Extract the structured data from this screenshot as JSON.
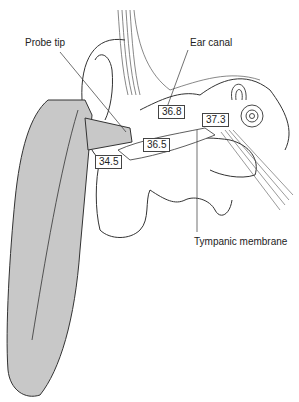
{
  "diagram": {
    "labels": {
      "probe_tip": "Probe tip",
      "ear_canal": "Ear canal",
      "tympanic_membrane": "Tympanic membrane"
    },
    "temperatures": [
      {
        "id": "outer",
        "value": "34.5"
      },
      {
        "id": "canal_mid",
        "value": "36.5"
      },
      {
        "id": "canal_inner",
        "value": "36.8"
      },
      {
        "id": "tympanic",
        "value": "37.3"
      }
    ],
    "colors": {
      "thermometer_fill": "#c8c8c8",
      "line": "#333333",
      "background": "#ffffff"
    }
  }
}
